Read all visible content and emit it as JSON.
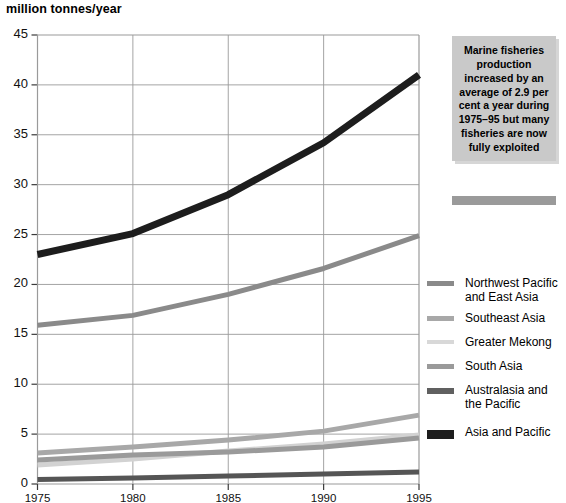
{
  "chart_data": {
    "type": "line",
    "title": "million tonnes/year",
    "xlabel": "",
    "ylabel": "million tonnes/year",
    "x": [
      1975,
      1980,
      1985,
      1990,
      1995
    ],
    "xlim": [
      1975,
      1995
    ],
    "ylim": [
      0,
      45
    ],
    "yticks": [
      0,
      5,
      10,
      15,
      20,
      25,
      30,
      35,
      40,
      45
    ],
    "xticks": [
      1975,
      1980,
      1985,
      1990,
      1995
    ],
    "grid": true,
    "legend_position": "right",
    "series": [
      {
        "name": "Northwest Pacific and East Asia",
        "color": "#8a8a8a",
        "width": 5,
        "values": [
          15.9,
          16.9,
          19.0,
          21.6,
          24.9
        ]
      },
      {
        "name": "Southeast Asia",
        "color": "#a8a8a8",
        "width": 5,
        "values": [
          3.1,
          3.7,
          4.4,
          5.3,
          6.9
        ]
      },
      {
        "name": "Greater Mekong",
        "color": "#d2d2d2",
        "width": 5,
        "values": [
          1.9,
          2.5,
          3.3,
          4.0,
          4.9
        ]
      },
      {
        "name": "South Asia",
        "color": "#9a9a9a",
        "width": 5,
        "values": [
          2.4,
          2.9,
          3.2,
          3.7,
          4.6
        ]
      },
      {
        "name": "Australasia and the Pacific",
        "color": "#555555",
        "width": 5,
        "values": [
          0.45,
          0.6,
          0.8,
          1.0,
          1.2
        ]
      },
      {
        "name": "Asia and Pacific",
        "color": "#1d1d1d",
        "width": 7,
        "values": [
          23.0,
          25.1,
          29.0,
          34.2,
          41.0
        ]
      }
    ]
  },
  "callout": {
    "text": "Marine fisheries production increased by an average of 2.9 per cent a year during 1975–95 but many fisheries are now fully exploited"
  },
  "legend": {
    "items": [
      {
        "label": "Northwest Pacific\nand East Asia",
        "color": "#8a8a8a",
        "height": 5
      },
      {
        "label": "Southeast Asia",
        "color": "#a8a8a8",
        "height": 5
      },
      {
        "label": "Greater Mekong",
        "color": "#d8d8d8",
        "height": 4
      },
      {
        "label": "South Asia",
        "color": "#9a9a9a",
        "height": 5
      },
      {
        "label": "Australasia and\nthe Pacific",
        "color": "#606060",
        "height": 6
      },
      {
        "label": "Asia and Pacific",
        "color": "#1d1d1d",
        "height": 9
      }
    ]
  },
  "colors": {
    "grid": "#9a9a9a",
    "axis": "#3a3a3a",
    "text": "#000000",
    "callout_bg": "#c9c9c9",
    "callout_bar": "#9a9a9a"
  }
}
